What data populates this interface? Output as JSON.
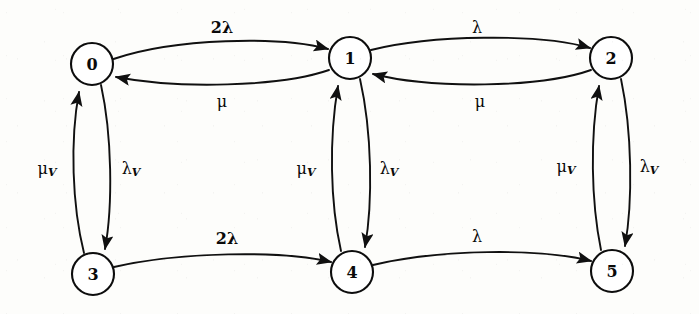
{
  "diagram": {
    "type": "state-transition-diagram",
    "title": "",
    "stroke_color": "#101010",
    "node_fill": "#ffffff",
    "background": "#fdfdfb",
    "node_radius": 21,
    "nodes": [
      {
        "id": "0",
        "label": "0",
        "cx": 92,
        "cy": 64,
        "row": "top",
        "col": 0
      },
      {
        "id": "1",
        "label": "1",
        "cx": 350,
        "cy": 58,
        "row": "top",
        "col": 1
      },
      {
        "id": "2",
        "label": "2",
        "cx": 611,
        "cy": 58,
        "row": "top",
        "col": 2
      },
      {
        "id": "3",
        "label": "3",
        "cx": 93,
        "cy": 274,
        "row": "bottom",
        "col": 0
      },
      {
        "id": "4",
        "label": "4",
        "cx": 352,
        "cy": 272,
        "row": "bottom",
        "col": 1
      },
      {
        "id": "5",
        "label": "5",
        "cx": 612,
        "cy": 271,
        "row": "bottom",
        "col": 2
      }
    ],
    "edges": [
      {
        "id": "e01",
        "from": "0",
        "to": "1",
        "label": "2λ",
        "bold": true,
        "subscript": "",
        "label_x": 222,
        "label_y": 27,
        "orientation": "horizontal",
        "position": "top-left-upper"
      },
      {
        "id": "e10",
        "from": "1",
        "to": "0",
        "label": "μ",
        "bold": false,
        "subscript": "",
        "label_x": 222,
        "label_y": 101,
        "orientation": "horizontal",
        "position": "top-left-lower"
      },
      {
        "id": "e12",
        "from": "1",
        "to": "2",
        "label": "λ",
        "bold": false,
        "subscript": "",
        "label_x": 477,
        "label_y": 27,
        "orientation": "horizontal",
        "position": "top-right-upper"
      },
      {
        "id": "e21",
        "from": "2",
        "to": "1",
        "label": "μ",
        "bold": false,
        "subscript": "",
        "label_x": 480,
        "label_y": 101,
        "orientation": "horizontal",
        "position": "top-right-lower"
      },
      {
        "id": "e30",
        "from": "3",
        "to": "0",
        "label": "μ",
        "bold": false,
        "subscript": "V",
        "label_x": 47,
        "label_y": 168,
        "orientation": "vertical",
        "position": "left-up"
      },
      {
        "id": "e03",
        "from": "0",
        "to": "3",
        "label": "λ",
        "bold": false,
        "subscript": "V",
        "label_x": 131,
        "label_y": 168,
        "orientation": "vertical",
        "position": "left-down"
      },
      {
        "id": "e41",
        "from": "4",
        "to": "1",
        "label": "μ",
        "bold": false,
        "subscript": "V",
        "label_x": 306,
        "label_y": 168,
        "orientation": "vertical",
        "position": "mid-up"
      },
      {
        "id": "e14",
        "from": "1",
        "to": "4",
        "label": "λ",
        "bold": false,
        "subscript": "V",
        "label_x": 389,
        "label_y": 168,
        "orientation": "vertical",
        "position": "mid-down"
      },
      {
        "id": "e52",
        "from": "5",
        "to": "2",
        "label": "μ",
        "bold": false,
        "subscript": "V",
        "label_x": 566,
        "label_y": 166,
        "orientation": "vertical",
        "position": "right-up"
      },
      {
        "id": "e25",
        "from": "2",
        "to": "5",
        "label": "λ",
        "bold": false,
        "subscript": "V",
        "label_x": 649,
        "label_y": 166,
        "orientation": "vertical",
        "position": "right-down"
      },
      {
        "id": "e34",
        "from": "3",
        "to": "4",
        "label": "2λ",
        "bold": true,
        "subscript": "",
        "label_x": 227,
        "label_y": 238,
        "orientation": "horizontal",
        "position": "bottom-left"
      },
      {
        "id": "e45",
        "from": "4",
        "to": "5",
        "label": "λ",
        "bold": false,
        "subscript": "",
        "label_x": 477,
        "label_y": 236,
        "orientation": "horizontal",
        "position": "bottom-right"
      }
    ]
  }
}
